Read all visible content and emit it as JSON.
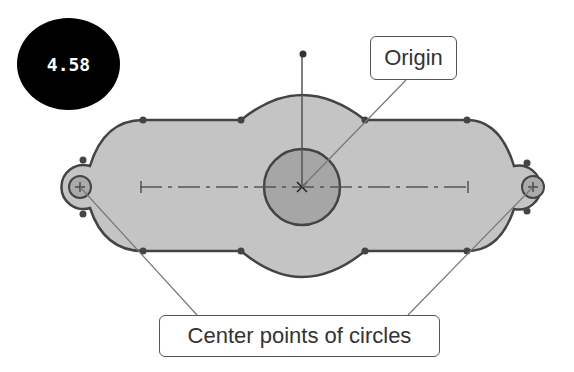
{
  "figure": {
    "number_badge": "4.58",
    "callouts": {
      "origin": "Origin",
      "centers": "Center points of circles"
    },
    "colors": {
      "body_fill": "#c4c4c4",
      "center_circle_fill": "#a6a6a6",
      "outline": "#444444",
      "badge_bg": "#000000",
      "leader_line": "#777777"
    }
  }
}
